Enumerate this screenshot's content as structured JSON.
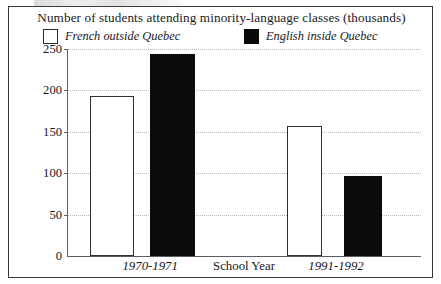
{
  "chart_data": {
    "type": "bar",
    "title": "Number of students attending minority-language classes (thousands)",
    "xlabel": "School Year",
    "ylabel": "",
    "categories": [
      "1970-1971",
      "1991-1992"
    ],
    "series": [
      {
        "name": "French outside Quebec",
        "values": [
          193,
          157
        ],
        "color": "#ffffff",
        "style": "open"
      },
      {
        "name": "English inside Quebec",
        "values": [
          244,
          97
        ],
        "color": "#0b0b0b",
        "style": "filled"
      }
    ],
    "ylim": [
      0,
      250
    ],
    "yticks": [
      0,
      50,
      100,
      150,
      200,
      250
    ],
    "ytick_labels": [
      "0",
      "50",
      "100",
      "150",
      "200",
      "250"
    ],
    "grid": true,
    "legend_position": "top"
  },
  "legend": {
    "items": [
      {
        "label": "French outside Quebec",
        "swatch": "open-square-icon"
      },
      {
        "label": "English inside Quebec",
        "swatch": "filled-square-icon"
      }
    ]
  },
  "axis": {
    "y_ticks": [
      "250",
      "200",
      "150",
      "100",
      "50",
      "0"
    ],
    "x_group_left": "1970-1971",
    "x_axis_name": "School Year",
    "x_group_right": "1991-1992"
  },
  "colors": {
    "frame": "#3a3a3e",
    "gridline": "#b9b9bd",
    "bar_filled": "#0b0b0b",
    "bar_open_border": "#2e2e33",
    "text": "#17171a"
  }
}
